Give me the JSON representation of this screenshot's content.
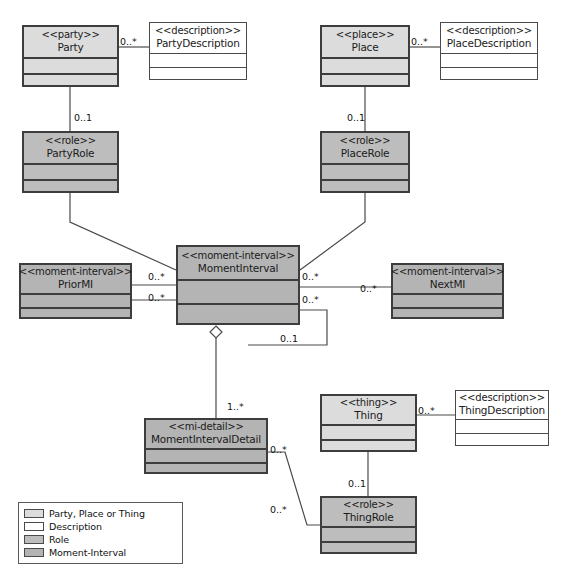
{
  "diagram": {
    "type": "uml-class-diagram",
    "colors": {
      "party_place_thing": "#dcdcdc",
      "description": "#ffffff",
      "role": "#bdbdbd",
      "moment_interval": "#b4b4b4",
      "line": "#4a4a4a",
      "text": "#1b1b1b"
    }
  },
  "classes": [
    {
      "id": "party",
      "stereotype": "<<party>>",
      "name": "Party",
      "kind": "party_place_thing",
      "x": 22,
      "y": 25,
      "w": 97,
      "h": 62,
      "hdr_h": 30,
      "cmp_h": 16
    },
    {
      "id": "party_description",
      "stereotype": "<<description>>",
      "name": "PartyDescription",
      "kind": "description",
      "x": 149,
      "y": 22,
      "w": 98,
      "h": 58,
      "hdr_h": 30,
      "cmp_h": 14
    },
    {
      "id": "party_role",
      "stereotype": "<<role>>",
      "name": "PartyRole",
      "kind": "role",
      "x": 22,
      "y": 131,
      "w": 97,
      "h": 62,
      "hdr_h": 30,
      "cmp_h": 16
    },
    {
      "id": "place",
      "stereotype": "<<place>>",
      "name": "Place",
      "kind": "party_place_thing",
      "x": 320,
      "y": 25,
      "w": 90,
      "h": 62,
      "hdr_h": 30,
      "cmp_h": 16
    },
    {
      "id": "place_description",
      "stereotype": "<<description>>",
      "name": "PlaceDescription",
      "kind": "description",
      "x": 440,
      "y": 22,
      "w": 98,
      "h": 58,
      "hdr_h": 30,
      "cmp_h": 14
    },
    {
      "id": "place_role",
      "stereotype": "<<role>>",
      "name": "PlaceRole",
      "kind": "role",
      "x": 320,
      "y": 131,
      "w": 90,
      "h": 62,
      "hdr_h": 30,
      "cmp_h": 16
    },
    {
      "id": "prior_mi",
      "stereotype": "<<moment-interval>>",
      "name": "PriorMI",
      "kind": "moment_interval",
      "x": 19,
      "y": 263,
      "w": 113,
      "h": 56,
      "hdr_h": 28,
      "cmp_h": 14
    },
    {
      "id": "moment_interval",
      "stereotype": "<<moment-interval>>",
      "name": "MomentInterval",
      "kind": "moment_interval",
      "x": 176,
      "y": 245,
      "w": 124,
      "h": 80,
      "hdr_h": 32,
      "cmp_h": 24
    },
    {
      "id": "next_mi",
      "stereotype": "<<moment-interval>>",
      "name": "NextMI",
      "kind": "moment_interval",
      "x": 391,
      "y": 263,
      "w": 113,
      "h": 56,
      "hdr_h": 28,
      "cmp_h": 14
    },
    {
      "id": "moment_interval_detail",
      "stereotype": "<<mi-detail>>",
      "name": "MomentIntervalDetail",
      "kind": "moment_interval",
      "x": 144,
      "y": 418,
      "w": 124,
      "h": 56,
      "hdr_h": 28,
      "cmp_h": 14
    },
    {
      "id": "thing",
      "stereotype": "<<thing>>",
      "name": "Thing",
      "kind": "party_place_thing",
      "x": 320,
      "y": 394,
      "w": 97,
      "h": 58,
      "hdr_h": 28,
      "cmp_h": 15
    },
    {
      "id": "thing_description",
      "stereotype": "<<description>>",
      "name": "ThingDescription",
      "kind": "description",
      "x": 455,
      "y": 390,
      "w": 94,
      "h": 56,
      "hdr_h": 28,
      "cmp_h": 14
    },
    {
      "id": "thing_role",
      "stereotype": "<<role>>",
      "name": "ThingRole",
      "kind": "role",
      "x": 320,
      "y": 496,
      "w": 97,
      "h": 58,
      "hdr_h": 28,
      "cmp_h": 15
    }
  ],
  "multiplicities": [
    {
      "id": "party-desc",
      "label": "0..*",
      "x": 120,
      "y": 36
    },
    {
      "id": "party-partyrole",
      "label": "0..1",
      "x": 74,
      "y": 112
    },
    {
      "id": "place-desc",
      "label": "0..*",
      "x": 411,
      "y": 36
    },
    {
      "id": "place-placerole",
      "label": "0..1",
      "x": 347,
      "y": 112
    },
    {
      "id": "priormi-mi",
      "label": "0..*",
      "x": 148,
      "y": 271
    },
    {
      "id": "priormi-mi-2",
      "label": "0..*",
      "x": 148,
      "y": 292
    },
    {
      "id": "mi-nextmi-left",
      "label": "0..*",
      "x": 302,
      "y": 271
    },
    {
      "id": "mi-nextmi-right",
      "label": "0..*",
      "x": 360,
      "y": 283
    },
    {
      "id": "mi-self-top",
      "label": "0..*",
      "x": 302,
      "y": 294
    },
    {
      "id": "mi-self-bottom",
      "label": "0..1",
      "x": 280,
      "y": 333
    },
    {
      "id": "mi-detail",
      "label": "1..*",
      "x": 227,
      "y": 401
    },
    {
      "id": "detail-thingrole",
      "label": "0..*",
      "x": 270,
      "y": 444
    },
    {
      "id": "detail-thingrole-2",
      "label": "0..*",
      "x": 270,
      "y": 504
    },
    {
      "id": "thing-desc",
      "label": "0..*",
      "x": 418,
      "y": 405
    },
    {
      "id": "thing-thingrole",
      "label": "0..1",
      "x": 348,
      "y": 478
    }
  ],
  "legend": {
    "x": 18,
    "y": 502,
    "w": 165,
    "h": 62,
    "items": [
      {
        "label": "Party, Place or Thing",
        "kind": "party_place_thing"
      },
      {
        "label": "Description",
        "kind": "description"
      },
      {
        "label": "Role",
        "kind": "role"
      },
      {
        "label": "Moment-Interval",
        "kind": "moment_interval"
      }
    ]
  }
}
